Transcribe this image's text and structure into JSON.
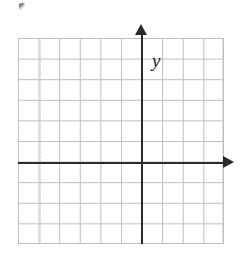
{
  "figure": {
    "kind": "blank-cartesian-coordinate-grid",
    "background_color": "#ffffff"
  },
  "chart_data": {
    "type": "scatter",
    "title": "",
    "subtitle": "",
    "xlabel": "x",
    "ylabel": "y",
    "xlim": [
      -6,
      4
    ],
    "ylim": [
      -4,
      6
    ],
    "x_tick_labels": [],
    "y_tick_labels": [],
    "grid": true,
    "grid_columns": 10,
    "grid_rows": 10,
    "grid_cell_units": 1,
    "origin_column_from_left": 6,
    "origin_row_from_top": 6,
    "legend": null,
    "legend_position": "none",
    "series": [],
    "annotations": [],
    "colors": {
      "grid_line": "#b9b9b9",
      "axis_line": "#2b2b2b",
      "label_text": "#1a1a1a",
      "background": "#ffffff"
    }
  },
  "axes": {
    "x_label": "x",
    "y_label": "y",
    "x_arrow_direction": "right",
    "y_arrow_direction": "up"
  },
  "artifacts": {
    "scan_speck_label": "scan-speck"
  }
}
